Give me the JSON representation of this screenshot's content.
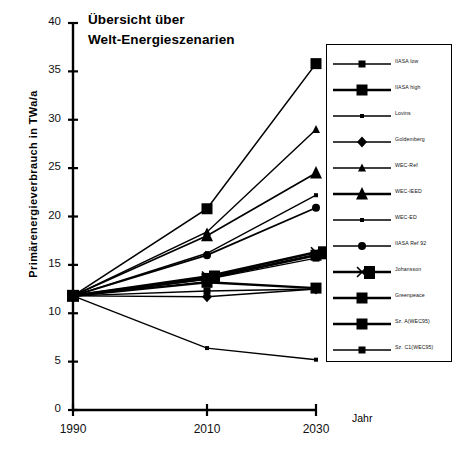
{
  "title": {
    "line1": "Übersicht über",
    "line2": "Welt-Energieszenarien"
  },
  "axes": {
    "ylabel": "Primärenergieverbrauch in TWa/a",
    "xlabel": "Jahr",
    "yticks": [
      "0",
      "5",
      "10",
      "15",
      "20",
      "25",
      "30",
      "35",
      "40"
    ],
    "xticks": [
      "1990",
      "2010",
      "2030"
    ]
  },
  "chart_data": {
    "type": "line",
    "title": "Übersicht über Welt-Energieszenarien",
    "xlabel": "Jahr",
    "ylabel": "Primärenergieverbrauch in TWa/a",
    "x": [
      1990,
      2010,
      2030
    ],
    "xlim": [
      1990,
      2030
    ],
    "ylim": [
      0,
      40
    ],
    "ytick_step": 5,
    "grid": false,
    "legend_position": "right",
    "units": "TWa/a",
    "series": [
      {
        "name": "IIASA low",
        "marker": "square-small",
        "values": [
          11.8,
          13.5,
          15.7
        ],
        "linewidth": 1.4
      },
      {
        "name": "IIASA high",
        "marker": "square-large",
        "values": [
          11.8,
          20.8,
          35.8
        ],
        "linewidth": 1.6
      },
      {
        "name": "Lovins",
        "marker": "square-tiny",
        "values": [
          11.8,
          6.4,
          5.2
        ],
        "linewidth": 1.4
      },
      {
        "name": "Goldemberg",
        "marker": "diamond",
        "values": [
          11.8,
          11.7,
          12.5
        ],
        "linewidth": 1.4
      },
      {
        "name": "WEC-Ref",
        "marker": "triangle-small",
        "values": [
          11.8,
          18.4,
          29.0
        ],
        "linewidth": 1.5
      },
      {
        "name": "WEC-IEED",
        "marker": "triangle-large",
        "values": [
          11.8,
          18.0,
          24.5
        ],
        "linewidth": 1.7
      },
      {
        "name": "WEC-ED",
        "marker": "square-tiny",
        "values": [
          11.8,
          16.2,
          22.2
        ],
        "linewidth": 1.4
      },
      {
        "name": "IIASA Ref 92",
        "marker": "circle",
        "values": [
          11.8,
          16.0,
          20.9
        ],
        "linewidth": 1.8
      },
      {
        "name": "Johansson",
        "marker": "x-square",
        "values": [
          11.8,
          13.8,
          16.3
        ],
        "linewidth": 2.6
      },
      {
        "name": "Greenpeace",
        "marker": "square-large",
        "values": [
          11.8,
          13.6,
          16.0
        ],
        "linewidth": 2.8
      },
      {
        "name": "Sz. A(WEC95)",
        "marker": "square-large",
        "values": [
          11.8,
          13.2,
          12.6
        ],
        "linewidth": 2.4
      },
      {
        "name": "Sz. C1(WEC95)",
        "marker": "square-small",
        "values": [
          11.8,
          12.3,
          12.5
        ],
        "linewidth": 1.4
      }
    ]
  },
  "legend": {
    "items": [
      {
        "label": "IIASA low",
        "marker": "square-small"
      },
      {
        "label": "IIASA high",
        "marker": "square-large"
      },
      {
        "label": "Lovins",
        "marker": "square-tiny"
      },
      {
        "label": "Goldemberg",
        "marker": "diamond"
      },
      {
        "label": "WEC-Ref",
        "marker": "triangle-small"
      },
      {
        "label": "WEC-IEED",
        "marker": "triangle-large"
      },
      {
        "label": "WEC-ED",
        "marker": "square-tiny"
      },
      {
        "label": "IIASA Ref 92",
        "marker": "circle"
      },
      {
        "label": "Johansson",
        "marker": "x-square"
      },
      {
        "label": "Greenpeace",
        "marker": "square-large"
      },
      {
        "label": "Sz. A(WEC95)",
        "marker": "square-large"
      },
      {
        "label": "Sz. C1(WEC95)",
        "marker": "square-small"
      }
    ]
  },
  "colors": {
    "ink": "#000000",
    "background": "#ffffff"
  }
}
